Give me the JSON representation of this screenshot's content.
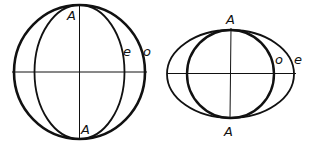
{
  "diagram": {
    "colors": {
      "stroke": "#111111",
      "background": "#ffffff"
    },
    "left_figure": {
      "center": [
        79.5,
        72
      ],
      "outer_circle": {
        "label": "o",
        "rx": 65.5,
        "ry": 67
      },
      "inner_ellipse": {
        "label": "e",
        "rx": 45,
        "ry": 67
      },
      "optic_axis_label_top": "A",
      "optic_axis_label_bottom": "A",
      "label_e": "e",
      "label_o": "o"
    },
    "right_figure": {
      "center": [
        231,
        74
      ],
      "inner_circle": {
        "label": "o",
        "rx": 43.5,
        "ry": 44
      },
      "outer_ellipse": {
        "label": "e",
        "rx": 63.5,
        "ry": 44
      },
      "optic_axis_label_top": "A",
      "optic_axis_label_bottom": "A",
      "label_o": "o",
      "label_e": "e"
    }
  }
}
